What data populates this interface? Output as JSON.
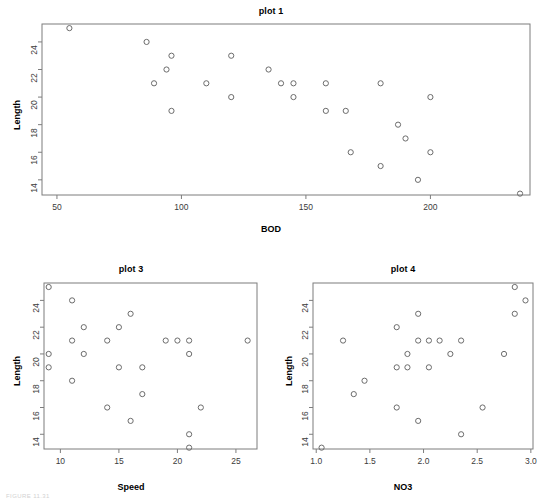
{
  "figure": {
    "background": "#ffffff",
    "point_color": "#6c6c6c",
    "axis_color": "#7d7d7d",
    "text_color": "#1a1a1a",
    "footer_note": "FIGURE 11.31"
  },
  "chart_data": [
    {
      "id": "plot1",
      "type": "scatter",
      "title": "plot 1",
      "xlabel": "BOD",
      "ylabel": "Length",
      "xlim": [
        44,
        240
      ],
      "ylim": [
        12.9,
        25.3
      ],
      "xticks": [
        50,
        100,
        150,
        200
      ],
      "xtick_labels": [
        "50",
        "100",
        "150",
        "200"
      ],
      "yticks": [
        14,
        16,
        18,
        20,
        22,
        24
      ],
      "ytick_labels": [
        "14",
        "16",
        "18",
        "20",
        "22",
        "24"
      ],
      "grid": false,
      "legend": "none",
      "x": [
        55,
        86,
        89,
        94,
        96,
        96,
        110,
        120,
        120,
        135,
        140,
        145,
        145,
        158,
        158,
        166,
        168,
        180,
        180,
        187,
        190,
        195,
        200,
        200,
        236
      ],
      "y": [
        25,
        24,
        21,
        22,
        23,
        19,
        21,
        23,
        20,
        22,
        21,
        21,
        20,
        21,
        19,
        19,
        16,
        21,
        15,
        18,
        17,
        14,
        20,
        16,
        13
      ]
    },
    {
      "id": "plot3",
      "type": "scatter",
      "title": "plot 3",
      "xlabel": "Speed",
      "ylabel": "Length",
      "xlim": [
        8.6,
        26.8
      ],
      "ylim": [
        12.9,
        25.3
      ],
      "xticks": [
        10,
        15,
        20,
        25
      ],
      "xtick_labels": [
        "10",
        "15",
        "20",
        "25"
      ],
      "yticks": [
        14,
        16,
        18,
        20,
        22,
        24
      ],
      "ytick_labels": [
        "14",
        "16",
        "18",
        "20",
        "22",
        "24"
      ],
      "grid": false,
      "legend": "none",
      "x": [
        9,
        9,
        9,
        11,
        11,
        11,
        12,
        12,
        14,
        14,
        15,
        15,
        16,
        16,
        17,
        17,
        19,
        20,
        21,
        21,
        21,
        21,
        22,
        26
      ],
      "y": [
        25,
        20,
        19,
        24,
        21,
        18,
        22,
        20,
        21,
        16,
        22,
        19,
        23,
        15,
        19,
        17,
        21,
        21,
        21,
        20,
        14,
        13,
        16,
        21
      ]
    },
    {
      "id": "plot4",
      "type": "scatter",
      "title": "plot 4",
      "xlabel": "NO3",
      "ylabel": "Length",
      "xlim": [
        0.97,
        3.02
      ],
      "ylim": [
        12.9,
        25.3
      ],
      "xticks": [
        1.0,
        1.5,
        2.0,
        2.5,
        3.0
      ],
      "xtick_labels": [
        "1.0",
        "1.5",
        "2.0",
        "2.5",
        "3.0"
      ],
      "yticks": [
        14,
        16,
        18,
        20,
        22,
        24
      ],
      "ytick_labels": [
        "14",
        "16",
        "18",
        "20",
        "22",
        "24"
      ],
      "grid": false,
      "legend": "none",
      "x": [
        1.05,
        1.25,
        1.35,
        1.45,
        1.75,
        1.75,
        1.75,
        1.85,
        1.85,
        1.95,
        1.95,
        1.95,
        2.05,
        2.05,
        2.15,
        2.25,
        2.35,
        2.35,
        2.55,
        2.75,
        2.85,
        2.85,
        2.95
      ],
      "y": [
        13,
        21,
        17,
        18,
        22,
        19,
        16,
        20,
        19,
        23,
        21,
        15,
        21,
        19,
        21,
        20,
        21,
        14,
        16,
        20,
        25,
        23,
        24
      ]
    }
  ]
}
